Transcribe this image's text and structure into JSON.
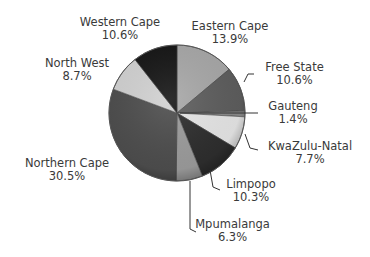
{
  "chart_data": {
    "type": "pie",
    "title": "",
    "start_angle": "12 o'clock",
    "direction": "clockwise",
    "legend": "none (labels on slices with leader lines)",
    "slices": [
      {
        "label": "Eastern Cape",
        "value": 13.9,
        "display": "13.9%",
        "color": "#a8a8a8"
      },
      {
        "label": "Free State",
        "value": 10.6,
        "display": "10.6%",
        "color": "#5e5e5e"
      },
      {
        "label": "Gauteng",
        "value": 1.4,
        "display": "1.4%",
        "color": "#8a8a8a"
      },
      {
        "label": "KwaZulu-Natal",
        "value": 7.7,
        "display": "7.7%",
        "color": "#e6e6e6"
      },
      {
        "label": "Limpopo",
        "value": 10.3,
        "display": "10.3%",
        "color": "#2e2e2e"
      },
      {
        "label": "Mpumalanga",
        "value": 6.3,
        "display": "6.3%",
        "color": "#9c9c9c"
      },
      {
        "label": "Northern Cape",
        "value": 30.5,
        "display": "30.5%",
        "color": "#4e4e4e"
      },
      {
        "label": "North West",
        "value": 8.7,
        "display": "8.7%",
        "color": "#d2d2d2"
      },
      {
        "label": "Western Cape",
        "value": 10.6,
        "display": "10.6%",
        "color": "#161616"
      }
    ]
  },
  "labels": {
    "western_cape": {
      "name": "Western Cape",
      "pct": "10.6%"
    },
    "eastern_cape": {
      "name": "Eastern Cape",
      "pct": "13.9%"
    },
    "north_west": {
      "name": "North West",
      "pct": "8.7%"
    },
    "free_state": {
      "name": "Free State",
      "pct": "10.6%"
    },
    "gauteng": {
      "name": "Gauteng",
      "pct": "1.4%"
    },
    "kwazulu_natal": {
      "name": "KwaZulu-Natal",
      "pct": "7.7%"
    },
    "northern_cape": {
      "name": "Northern Cape",
      "pct": "30.5%"
    },
    "limpopo": {
      "name": "Limpopo",
      "pct": "10.3%"
    },
    "mpumalanga": {
      "name": "Mpumalanga",
      "pct": "6.3%"
    }
  }
}
